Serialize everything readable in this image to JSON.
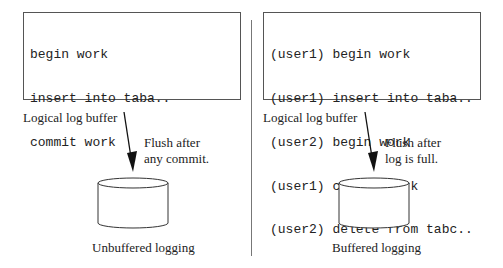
{
  "left_panel": {
    "buffer_lines": [
      "begin work",
      "insert into taba..",
      "commit work"
    ],
    "buffer_label": "Logical log buffer",
    "flush_note_line1": "Flush after",
    "flush_note_line2": "any commit.",
    "log_label": "Logical log",
    "caption": "Unbuffered logging"
  },
  "right_panel": {
    "buffer_lines": [
      "(user1) begin work",
      "(user1) insert into taba..",
      "(user2) begin work",
      "(user1) commit work",
      "(user2) delete from tabc.."
    ],
    "buffer_label": "Logical log buffer",
    "flush_note_line1": "Flush after",
    "flush_note_line2": "log is full.",
    "log_label": "Logical log",
    "caption": "Buffered logging"
  }
}
